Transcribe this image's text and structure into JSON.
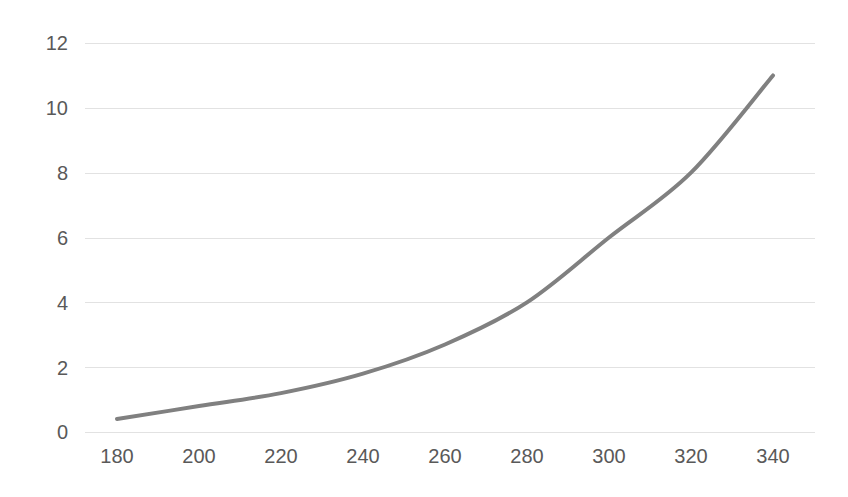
{
  "chart_data": {
    "type": "line",
    "title": "",
    "subtitle": "",
    "xlabel": "",
    "ylabel": "",
    "x": [
      180,
      200,
      220,
      240,
      260,
      280,
      300,
      320,
      340
    ],
    "series": [
      {
        "name": "series-1",
        "values": [
          0.4,
          0.8,
          1.2,
          1.8,
          2.7,
          4.0,
          6.0,
          8.0,
          11.0
        ],
        "color": "#808080",
        "line_width": 4,
        "smooth": true,
        "markers": false
      }
    ],
    "xlim": [
      180,
      340
    ],
    "ylim": [
      0,
      12
    ],
    "xticks": [
      180,
      200,
      220,
      240,
      260,
      280,
      300,
      320,
      340
    ],
    "yticks": [
      0,
      2,
      4,
      6,
      8,
      10,
      12
    ],
    "xtick_labels": [
      "180",
      "200",
      "220",
      "240",
      "260",
      "280",
      "300",
      "320",
      "340"
    ],
    "ytick_labels": [
      "0",
      "2",
      "4",
      "6",
      "8",
      "10",
      "12"
    ],
    "grid": {
      "horizontal": true,
      "vertical": false,
      "color": "#e2e2e2"
    },
    "legend": {
      "visible": false,
      "position": "none",
      "entries": []
    },
    "background_color": "#ffffff",
    "tick_label_color": "#595959",
    "annotations": []
  }
}
